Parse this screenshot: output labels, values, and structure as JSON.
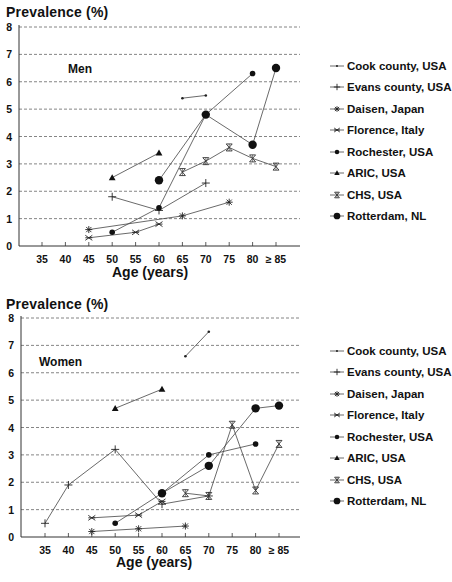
{
  "chart_data": [
    {
      "type": "line",
      "panel": "Men",
      "title": "Men",
      "ylabel": "Prevalence (%)",
      "xlabel": "Age (years)",
      "ylim": [
        0,
        8
      ],
      "yticks": [
        "0",
        "1",
        "2",
        "3",
        "4",
        "5",
        "6",
        "7",
        "8"
      ],
      "categories": [
        "35",
        "40",
        "45",
        "50",
        "55",
        "60",
        "65",
        "70",
        "75",
        "80",
        "≥ 85"
      ],
      "grid": "horizontal dashed",
      "legend_position": "right",
      "series": [
        {
          "name": "Cook county, USA",
          "marker": "dot",
          "points": [
            [
              65,
              5.4
            ],
            [
              70,
              5.5
            ]
          ]
        },
        {
          "name": "Evans county, USA",
          "marker": "plus",
          "points": [
            [
              50,
              1.8
            ],
            [
              60,
              1.3
            ],
            [
              70,
              2.3
            ]
          ]
        },
        {
          "name": "Daisen, Japan",
          "marker": "asterisk",
          "points": [
            [
              45,
              0.6
            ],
            [
              65,
              1.1
            ],
            [
              75,
              1.6
            ]
          ]
        },
        {
          "name": "Florence, Italy",
          "marker": "x",
          "points": [
            [
              45,
              0.3
            ],
            [
              55,
              0.5
            ],
            [
              60,
              0.8
            ]
          ]
        },
        {
          "name": "Rochester, USA",
          "marker": "diamond",
          "points": [
            [
              50,
              0.5
            ],
            [
              60,
              1.4
            ],
            [
              70,
              4.8
            ],
            [
              80,
              6.3
            ]
          ]
        },
        {
          "name": "ARIC, USA",
          "marker": "triangle",
          "points": [
            [
              50,
              2.5
            ],
            [
              60,
              3.4
            ]
          ]
        },
        {
          "name": "CHS, USA",
          "marker": "hourglass",
          "points": [
            [
              65,
              2.7
            ],
            [
              70,
              3.1
            ],
            [
              75,
              3.6
            ],
            [
              80,
              3.2
            ],
            [
              85,
              2.9
            ]
          ]
        },
        {
          "name": "Rotterdam, NL",
          "marker": "circle",
          "points": [
            [
              60,
              2.4
            ],
            [
              70,
              4.8
            ],
            [
              80,
              3.7
            ],
            [
              85,
              6.5
            ]
          ]
        }
      ]
    },
    {
      "type": "line",
      "panel": "Women",
      "title": "Women",
      "ylabel": "Prevalence (%)",
      "xlabel": "Age (years)",
      "ylim": [
        0,
        8
      ],
      "yticks": [
        "0",
        "1",
        "2",
        "3",
        "4",
        "5",
        "6",
        "7",
        "8"
      ],
      "categories": [
        "35",
        "40",
        "45",
        "50",
        "55",
        "60",
        "65",
        "70",
        "75",
        "80",
        "≥ 85"
      ],
      "grid": "horizontal dashed",
      "legend_position": "right",
      "series": [
        {
          "name": "Cook county, USA",
          "marker": "dot",
          "points": [
            [
              65,
              6.6
            ],
            [
              70,
              7.5
            ]
          ]
        },
        {
          "name": "Evans county, USA",
          "marker": "plus",
          "points": [
            [
              35,
              0.5
            ],
            [
              40,
              1.9
            ],
            [
              50,
              3.2
            ],
            [
              60,
              1.2
            ],
            [
              70,
              1.5
            ]
          ]
        },
        {
          "name": "Daisen, Japan",
          "marker": "asterisk",
          "points": [
            [
              45,
              0.2
            ],
            [
              55,
              0.3
            ],
            [
              65,
              0.4
            ]
          ]
        },
        {
          "name": "Florence, Italy",
          "marker": "x",
          "points": [
            [
              45,
              0.7
            ],
            [
              55,
              0.8
            ],
            [
              60,
              1.3
            ]
          ]
        },
        {
          "name": "Rochester, USA",
          "marker": "diamond",
          "points": [
            [
              50,
              0.5
            ],
            [
              60,
              1.6
            ],
            [
              70,
              3.0
            ],
            [
              80,
              3.4
            ]
          ]
        },
        {
          "name": "ARIC, USA",
          "marker": "triangle",
          "points": [
            [
              50,
              4.7
            ],
            [
              60,
              5.4
            ]
          ]
        },
        {
          "name": "CHS, USA",
          "marker": "hourglass",
          "points": [
            [
              65,
              1.6
            ],
            [
              70,
              1.5
            ],
            [
              75,
              4.1
            ],
            [
              80,
              1.7
            ],
            [
              85,
              3.4
            ]
          ]
        },
        {
          "name": "Rotterdam, NL",
          "marker": "circle",
          "points": [
            [
              60,
              1.6
            ],
            [
              70,
              2.6
            ],
            [
              80,
              4.7
            ],
            [
              85,
              4.8
            ]
          ]
        }
      ]
    }
  ],
  "men": {
    "ylabel": "Prevalence (%)",
    "panel_label": "Men",
    "xlabel": "Age (years)"
  },
  "women": {
    "ylabel": "Prevalence (%)",
    "panel_label": "Women",
    "xlabel": "Age (years)"
  },
  "legend": [
    {
      "label": "Cook county, USA",
      "marker": "dot"
    },
    {
      "label": "Evans county, USA",
      "marker": "plus"
    },
    {
      "label": "Daisen, Japan",
      "marker": "asterisk"
    },
    {
      "label": "Florence, Italy",
      "marker": "x"
    },
    {
      "label": "Rochester, USA",
      "marker": "diamond"
    },
    {
      "label": "ARIC, USA",
      "marker": "triangle"
    },
    {
      "label": "CHS, USA",
      "marker": "hourglass"
    },
    {
      "label": "Rotterdam, NL",
      "marker": "circle"
    }
  ]
}
